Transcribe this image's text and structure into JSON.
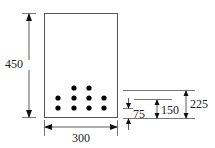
{
  "diagram": {
    "type": "beam-cross-section",
    "colors": {
      "line": "#555555",
      "dim": "#333333",
      "rebar": "#000000",
      "text": "#222222"
    },
    "section": {
      "width_label": "300",
      "height_label": "450"
    },
    "rebar": {
      "rows": [
        {
          "level": "75",
          "count": 4
        },
        {
          "level": "150",
          "count": 4
        },
        {
          "level": "225",
          "count": 2
        }
      ],
      "total": 10
    },
    "layer_dimensions": {
      "d1": "75",
      "d2": "150",
      "d3": "225"
    }
  }
}
